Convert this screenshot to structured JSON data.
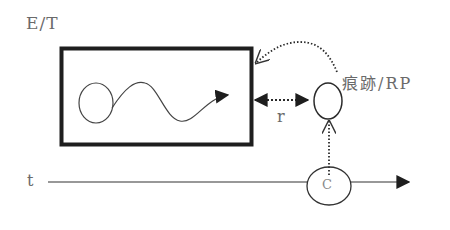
{
  "diagram": {
    "labels": {
      "et": "E/T",
      "rp": "痕跡/RP",
      "r": "r",
      "t": "t",
      "c": "C"
    },
    "nodes": [
      {
        "id": "et-box",
        "shape": "rectangle",
        "label": "E/T",
        "contains": [
          "loop-circle",
          "wavy-arrow"
        ]
      },
      {
        "id": "rp-circle",
        "shape": "circle",
        "label": "痕跡/RP"
      },
      {
        "id": "c-circle",
        "shape": "ellipse",
        "label": "C"
      }
    ],
    "edges": [
      {
        "from": "et-box",
        "to": "rp-circle",
        "style": "dotted",
        "direction": "bidirectional",
        "label": "r"
      },
      {
        "from": "rp-circle",
        "to": "et-box",
        "style": "dotted-curved",
        "direction": "forward",
        "label": ""
      },
      {
        "from": "c-circle",
        "to": "rp-circle",
        "style": "dotted",
        "direction": "forward",
        "label": ""
      },
      {
        "from": "timeline-start",
        "to": "timeline-end",
        "style": "solid",
        "direction": "forward",
        "label": "t",
        "through": "c-circle"
      }
    ],
    "colors": {
      "stroke": "#2a2a2a",
      "box_stroke": "#1e1e1e",
      "text": "#6a6a6a",
      "background": "#ffffff"
    }
  }
}
